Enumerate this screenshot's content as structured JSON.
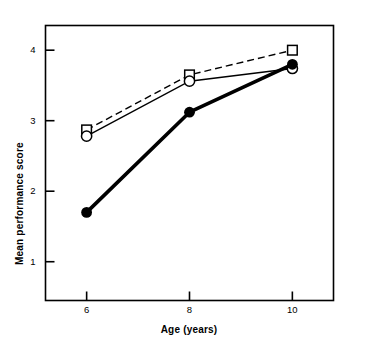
{
  "chart_data": {
    "type": "line",
    "title": "",
    "subtitle": "",
    "xlabel": "Age (years)",
    "ylabel": "Mean performance score",
    "x": [
      6,
      8,
      10
    ],
    "categories": [
      "6",
      "8",
      "10"
    ],
    "xtick_labels": [
      "6",
      "8",
      "10"
    ],
    "ytick_labels": [
      "1",
      "2",
      "3",
      "4"
    ],
    "ytick_values": [
      1,
      2,
      3,
      4
    ],
    "xlim": [
      5.2,
      10.8
    ],
    "ylim": [
      0.45,
      4.35
    ],
    "grid": false,
    "legend": "none",
    "frame": "box",
    "series": [
      {
        "name": "open-square-dashed",
        "marker": "open-square",
        "linestyle": "dashed",
        "linewidth": 1.4,
        "color": "#000000",
        "values": [
          2.87,
          3.65,
          4.0
        ]
      },
      {
        "name": "open-circle-solid",
        "marker": "open-circle",
        "linestyle": "solid",
        "linewidth": 1.4,
        "color": "#000000",
        "values": [
          2.78,
          3.56,
          3.74
        ]
      },
      {
        "name": "filled-circle-thick",
        "marker": "filled-circle",
        "linestyle": "solid",
        "linewidth": 3.6,
        "color": "#000000",
        "values": [
          1.7,
          3.12,
          3.8
        ]
      }
    ],
    "axis_color": "#000000",
    "background_color": "#ffffff"
  }
}
